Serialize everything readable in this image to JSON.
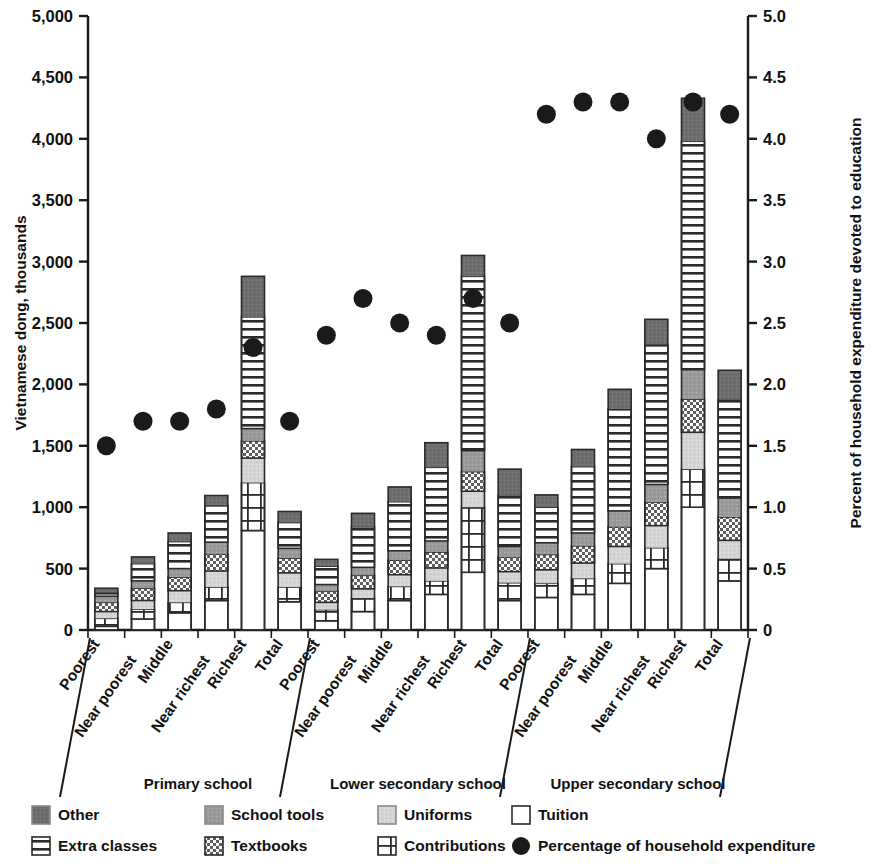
{
  "chart_data": {
    "type": "bar",
    "subtype": "stacked-bar-with-overlay-scatter",
    "title": "",
    "ylabel": "Vietnamese dong, thousands",
    "ylabel_right": "Percent of household expenditure devoted to education",
    "xlabel": "",
    "ylim": [
      0,
      5000
    ],
    "yticks": [
      "0",
      "500",
      "1,000",
      "1,500",
      "2,000",
      "2,500",
      "3,000",
      "3,500",
      "4,000",
      "4,500",
      "5,000"
    ],
    "ytick_values": [
      0,
      500,
      1000,
      1500,
      2000,
      2500,
      3000,
      3500,
      4000,
      4500,
      5000
    ],
    "ylim_right": [
      0,
      5.0
    ],
    "yticks_right": [
      "0",
      "0.5",
      "1.0",
      "1.5",
      "2.0",
      "2.5",
      "3.0",
      "3.5",
      "4.0",
      "4.5",
      "5.0"
    ],
    "ytick_values_right": [
      0,
      0.5,
      1.0,
      1.5,
      2.0,
      2.5,
      3.0,
      3.5,
      4.0,
      4.5,
      5.0
    ],
    "grid": false,
    "legend_position": "bottom",
    "categories": [
      "Poorest",
      "Near poorest",
      "Middle",
      "Near richest",
      "Richest",
      "Total",
      "Poorest",
      "Near poorest",
      "Middle",
      "Near richest",
      "Richest",
      "Total",
      "Poorest",
      "Near poorest",
      "Middle",
      "Near richest",
      "Richest",
      "Total"
    ],
    "groups": [
      {
        "label": "Primary school",
        "start": 0,
        "count": 6
      },
      {
        "label": "Lower secondary school",
        "start": 6,
        "count": 6
      },
      {
        "label": "Upper secondary school",
        "start": 12,
        "count": 6
      }
    ],
    "series": [
      {
        "name": "Tuition",
        "pattern": "white",
        "values": [
          30,
          90,
          140,
          240,
          810,
          230,
          75,
          150,
          240,
          290,
          470,
          240,
          265,
          290,
          380,
          500,
          1000,
          400
        ]
      },
      {
        "name": "Contributions",
        "pattern": "grid",
        "values": [
          65,
          80,
          85,
          110,
          390,
          120,
          90,
          110,
          115,
          110,
          530,
          145,
          115,
          130,
          160,
          170,
          310,
          180
        ]
      },
      {
        "name": "Uniforms",
        "pattern": "lightgray",
        "values": [
          55,
          70,
          95,
          130,
          200,
          115,
          60,
          75,
          95,
          105,
          130,
          90,
          110,
          125,
          140,
          180,
          300,
          150
        ]
      },
      {
        "name": "Textbooks",
        "pattern": "checker",
        "values": [
          75,
          100,
          110,
          140,
          140,
          120,
          90,
          110,
          120,
          130,
          160,
          120,
          125,
          140,
          160,
          190,
          270,
          190
        ]
      },
      {
        "name": "School tools",
        "pattern": "mediumgray",
        "values": [
          50,
          60,
          70,
          95,
          100,
          80,
          55,
          65,
          75,
          90,
          170,
          85,
          95,
          105,
          130,
          145,
          240,
          155
        ]
      },
      {
        "name": "Extra classes",
        "pattern": "hlines",
        "values": [
          30,
          140,
          220,
          300,
          910,
          210,
          150,
          330,
          400,
          600,
          1420,
          420,
          290,
          540,
          830,
          1140,
          1860,
          800
        ]
      },
      {
        "name": "Other",
        "pattern": "darkgray",
        "values": [
          35,
          55,
          70,
          80,
          330,
          90,
          55,
          110,
          120,
          200,
          170,
          210,
          100,
          140,
          160,
          205,
          350,
          240
        ]
      }
    ],
    "overlay": {
      "name": "Percentage of household expenditure",
      "axis": "right",
      "marker": "circle",
      "values": [
        1.5,
        1.7,
        1.7,
        1.8,
        2.3,
        1.7,
        2.4,
        2.7,
        2.5,
        2.4,
        2.7,
        2.5,
        4.2,
        4.3,
        4.3,
        4.0,
        4.3,
        4.2
      ]
    },
    "legend": [
      {
        "label": "Other",
        "pattern": "darkgray"
      },
      {
        "label": "School tools",
        "pattern": "mediumgray"
      },
      {
        "label": "Uniforms",
        "pattern": "lightgray"
      },
      {
        "label": "Tuition",
        "pattern": "white"
      },
      {
        "label": "Extra classes",
        "pattern": "hlines"
      },
      {
        "label": "Textbooks",
        "pattern": "checker"
      },
      {
        "label": "Contributions",
        "pattern": "grid"
      },
      {
        "label": "Percentage of household expenditure",
        "pattern": "dot"
      }
    ],
    "colors": {
      "dark_gray": "#6e6e6e",
      "medium_gray": "#9a9a9a",
      "light_gray": "#d2d2d2",
      "white": "#ffffff",
      "marker": "#1a1a1a",
      "axis": "#1a1a1a"
    }
  }
}
